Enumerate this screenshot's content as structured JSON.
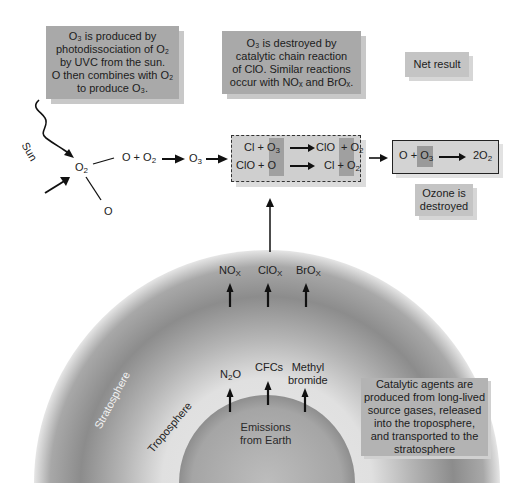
{
  "notes": {
    "production": {
      "line1": "O₃ is produced by",
      "line2": "photodissociation of O₂",
      "line3": "by UVC from the sun.",
      "line4": "O then combines with O₂",
      "line5": "to produce O₃."
    },
    "destruction": {
      "line1": "O₃ is destroyed by",
      "line2": "catalytic chain reaction",
      "line3": "of ClO. Similar reactions",
      "line4": "occur with NOₓ and BrOₓ."
    },
    "net": {
      "text": "Net result"
    },
    "ozone_destroyed": {
      "line1": "Ozone is",
      "line2": "destroyed"
    },
    "catalytic": {
      "line1": "Catalytic agents are",
      "line2": "produced from long-lived",
      "line3": "source gases, released",
      "line4": "into the troposphere,",
      "line5": "and transported to the",
      "line6": "stratosphere"
    }
  },
  "photolysis": {
    "sun_label": "Sun",
    "o2_label": "O",
    "o2_sub": "2",
    "o_product": "O",
    "combine_left": "O + O",
    "combine_sub": "2",
    "o3_label": "O",
    "o3_sub": "3"
  },
  "cycle_reactions": [
    {
      "left_a": "Cl",
      "plus": "+",
      "left_b": "O",
      "left_b_sub": "3",
      "right_a": "ClO",
      "right_b": "O",
      "right_b_sub": "2"
    },
    {
      "left_a": "ClO",
      "plus": "+",
      "left_b": "O",
      "left_b_sub": "",
      "right_a": "Cl",
      "right_b": "O",
      "right_b_sub": "2"
    }
  ],
  "net_reaction": {
    "left_a": "O",
    "plus": "+",
    "left_b": "O",
    "left_b_sub": "3",
    "right": "2O",
    "right_sub": "2"
  },
  "catalysts": [
    {
      "name": "NO",
      "sub": "X"
    },
    {
      "name": "ClO",
      "sub": "X"
    },
    {
      "name": "BrO",
      "sub": "X"
    }
  ],
  "source_gases": [
    {
      "name": "N",
      "sub": "2",
      "tail": "O"
    },
    {
      "name": "CFCs"
    },
    {
      "name": "Methyl",
      "name2": "bromide"
    }
  ],
  "layers": {
    "stratosphere": "Stratosphere",
    "troposphere": "Troposphere",
    "earth_line1": "Emissions",
    "earth_line2": "from Earth"
  },
  "colors": {
    "note_gray": "#a9a9a9",
    "note_light": "#c4c4c4",
    "highlight": "#8f8f8f",
    "arrow": "#111111"
  }
}
